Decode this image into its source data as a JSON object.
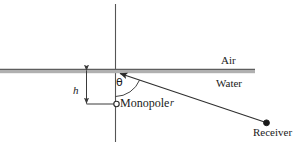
{
  "figure": {
    "background_color": "#ffffff",
    "width": 302,
    "height": 146,
    "labels": {
      "air": "Air",
      "water": "Water",
      "monopole": "Monopole",
      "receiver": "Receiver",
      "height": "h",
      "range": "r",
      "angle": "θ"
    },
    "colors": {
      "line": "#3a3a3a",
      "interface_band": "#a8a8a8",
      "interface_edge": "#6f6f6f",
      "text": "#1a1a1a",
      "marker_fill": "#ffffff",
      "receiver_fill": "#1a1a1a"
    },
    "geometry": {
      "interface_y": 70,
      "interface_x_start": 0,
      "interface_x_end": 255,
      "vertical_axis_x": 115,
      "vertical_axis_y_top": 4,
      "vertical_axis_y_bottom": 142,
      "origin": [
        115,
        70
      ],
      "monopole": [
        115,
        104
      ],
      "receiver": [
        266,
        123
      ],
      "dimension_line_x": 86,
      "dimension_top_y": 70,
      "dimension_bottom_y": 104,
      "angle_arc_radius": 26
    }
  }
}
